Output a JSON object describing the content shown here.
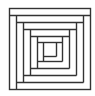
{
  "figure": {
    "stroke_color": "#333333",
    "background": "#ffffff"
  }
}
